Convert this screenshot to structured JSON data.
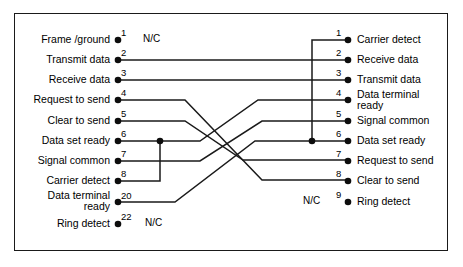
{
  "diagram": {
    "frame_color": "#1a1a1a",
    "wire_color": "#1a1a1a",
    "background": "#ffffff",
    "left_connector": {
      "name": "DB25 side",
      "pins": [
        {
          "number": "1",
          "label": "Frame /ground",
          "note": "N/C"
        },
        {
          "number": "2",
          "label": "Transmit data",
          "note": ""
        },
        {
          "number": "3",
          "label": "Receive data",
          "note": ""
        },
        {
          "number": "4",
          "label": "Request to send",
          "note": ""
        },
        {
          "number": "5",
          "label": "Clear to send",
          "note": ""
        },
        {
          "number": "6",
          "label": "Data set ready",
          "note": ""
        },
        {
          "number": "7",
          "label": "Signal common",
          "note": ""
        },
        {
          "number": "8",
          "label": "Carrier detect",
          "note": ""
        },
        {
          "number": "20",
          "label": "Data terminal ready",
          "label_line1": "Data terminal",
          "label_line2": "ready",
          "note": ""
        },
        {
          "number": "22",
          "label": "Ring detect",
          "note": "N/C"
        }
      ]
    },
    "right_connector": {
      "name": "DB9 side",
      "pins": [
        {
          "number": "1",
          "label": "Carrier detect",
          "note": ""
        },
        {
          "number": "2",
          "label": "Receive data",
          "note": ""
        },
        {
          "number": "3",
          "label": "Transmit data",
          "note": ""
        },
        {
          "number": "4",
          "label": "Data terminal ready",
          "label_line1": "Data terminal",
          "label_line2": "ready",
          "note": ""
        },
        {
          "number": "5",
          "label": "Signal common",
          "note": ""
        },
        {
          "number": "6",
          "label": "Data set ready",
          "note": ""
        },
        {
          "number": "7",
          "label": "Request to send",
          "note": ""
        },
        {
          "number": "8",
          "label": "Clear to send",
          "note": ""
        },
        {
          "number": "9",
          "label": "Ring detect",
          "note": "N/C"
        }
      ]
    },
    "connections": [
      {
        "from": "L2",
        "to": "R2",
        "description": "Transmit data to Receive data"
      },
      {
        "from": "L3",
        "to": "R3",
        "description": "Receive data to Transmit data"
      },
      {
        "from": "L4",
        "to": "R8",
        "description": "Request to send to Clear to send"
      },
      {
        "from": "L5",
        "to": "R7",
        "description": "Clear to send to Request to send"
      },
      {
        "from": "L6",
        "to": "R4",
        "description": "Data set ready to Data terminal ready"
      },
      {
        "from": "L8",
        "to": "L6",
        "description": "Carrier detect jumpered to Data set ready"
      },
      {
        "from": "L7",
        "to": "R5",
        "description": "Signal common to Signal common"
      },
      {
        "from": "L20",
        "to": "R6",
        "description": "Data terminal ready to Data set ready"
      },
      {
        "from": "R1",
        "to": "R6",
        "description": "Carrier detect jumpered to Data set ready"
      }
    ],
    "not_connected": [
      {
        "side": "left",
        "pin": "1",
        "text": "N/C"
      },
      {
        "side": "left",
        "pin": "22",
        "text": "N/C"
      },
      {
        "side": "right",
        "pin": "9",
        "text": "N/C"
      }
    ]
  }
}
